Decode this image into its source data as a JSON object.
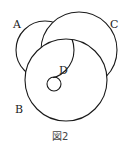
{
  "figure": {
    "caption": "図2",
    "labels": {
      "a": "A",
      "b": "B",
      "c": "C",
      "d": "D"
    },
    "circles": [
      {
        "id": "A",
        "cx": 45,
        "cy": 50,
        "r": 29,
        "visible": "partial (behind B and C)"
      },
      {
        "id": "C",
        "cx": 79,
        "cy": 50,
        "r": 38,
        "visible": "partial (behind B)"
      },
      {
        "id": "B",
        "cx": 66,
        "cy": 80,
        "r": 41,
        "visible": "full (front)"
      },
      {
        "id": "D",
        "cx": 54,
        "cy": 84,
        "r": 7,
        "visible": "full (inside B)"
      }
    ],
    "stroke_color": "#1a1a1a",
    "background": "#ffffff"
  }
}
